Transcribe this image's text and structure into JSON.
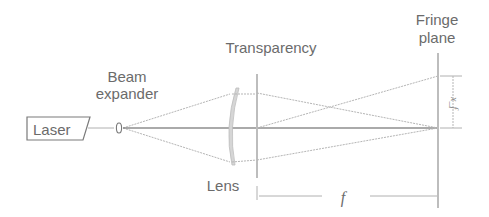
{
  "diagram": {
    "components": {
      "laser": {
        "label": "Laser"
      },
      "beam_expander": {
        "label_line1": "Beam",
        "label_line2": "expander"
      },
      "lens": {
        "label": "Lens"
      },
      "transparency": {
        "label": "Transparency"
      },
      "fringe_plane": {
        "label_line1": "Fringe",
        "label_line2": "plane"
      }
    },
    "dimensions": {
      "focal_length": {
        "label": "f"
      },
      "fringe_offset": {
        "label": "x_f"
      }
    },
    "colors": {
      "text": "#6b6b6b",
      "rays": "#b5b5b5",
      "optical_axis": "#8e8e8e",
      "planes": "#bdbdbd",
      "background": "#ffffff"
    }
  }
}
